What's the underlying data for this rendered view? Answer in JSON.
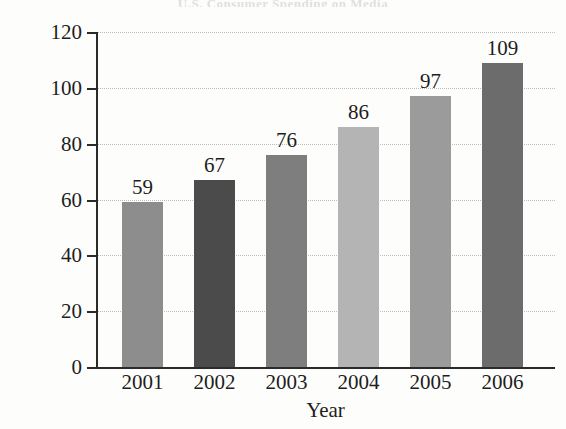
{
  "figure": {
    "title_remnant": "U.S. Consumer Spending on Media",
    "background_color": "#fdfdfc",
    "axis_color": "#2a2a2a",
    "grid_color": "#bdbdbd"
  },
  "chart_data": {
    "type": "bar",
    "title": "",
    "xlabel": "Year",
    "ylabel": "Hours per Person Aged 12 or Older",
    "categories": [
      "2001",
      "2002",
      "2003",
      "2004",
      "2005",
      "2006"
    ],
    "values": [
      59,
      67,
      76,
      86,
      97,
      109
    ],
    "value_labels": [
      "59",
      "67",
      "76",
      "86",
      "97",
      "109"
    ],
    "ylim": [
      0,
      120
    ],
    "ytick_labels": [
      "0",
      "20",
      "40",
      "60",
      "80",
      "100",
      "120"
    ],
    "ytick_values": [
      0,
      20,
      40,
      60,
      80,
      100,
      120
    ],
    "grid": "horizontal-dotted",
    "legend": "none",
    "bar_colors": [
      "#8d8d8d",
      "#4b4b4b",
      "#7e7e7e",
      "#b4b4b4",
      "#9b9b9b",
      "#6c6c6c"
    ]
  }
}
